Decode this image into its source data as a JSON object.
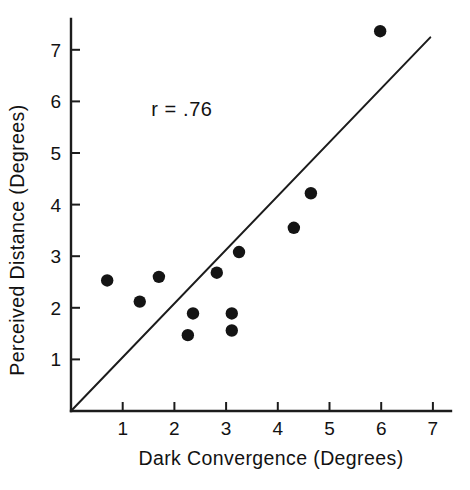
{
  "chart_data": {
    "type": "scatter",
    "title": "",
    "xlabel": "Dark Convergence  (Degrees)",
    "ylabel": "Perceived Distance (Degrees)",
    "xlim": [
      0,
      7.35
    ],
    "ylim": [
      0,
      7.6
    ],
    "xticks": [
      1,
      2,
      3,
      4,
      5,
      6,
      7
    ],
    "xticklabels": [
      "1",
      "2",
      "3",
      "4",
      "5",
      "6",
      "7"
    ],
    "yticks": [
      1,
      2,
      3,
      4,
      5,
      6,
      7
    ],
    "yticklabels": [
      "1",
      "2",
      "3",
      "4",
      "5",
      "6",
      "7"
    ],
    "grid": false,
    "legend": false,
    "annotations": [
      {
        "name": "correlation-annotation",
        "text": "r = .76",
        "x": 1.55,
        "y": 5.72
      }
    ],
    "reference_line": {
      "name": "identity-line",
      "description": "straight line from origin through data",
      "x0": 0.0,
      "y0": 0.0,
      "x1": 6.95,
      "y1": 7.24
    },
    "points": [
      {
        "x": 0.7,
        "y": 2.53
      },
      {
        "x": 1.33,
        "y": 2.12
      },
      {
        "x": 1.7,
        "y": 2.6
      },
      {
        "x": 2.26,
        "y": 1.47
      },
      {
        "x": 2.36,
        "y": 1.89
      },
      {
        "x": 2.82,
        "y": 2.68
      },
      {
        "x": 3.11,
        "y": 1.89
      },
      {
        "x": 3.11,
        "y": 1.56
      },
      {
        "x": 3.25,
        "y": 3.08
      },
      {
        "x": 4.31,
        "y": 3.55
      },
      {
        "x": 4.64,
        "y": 4.22
      },
      {
        "x": 5.98,
        "y": 7.36
      }
    ],
    "marker": {
      "shape": "circle",
      "color": "#141414",
      "radius_px": 6.2
    },
    "axis_color": "#1c1c1c"
  }
}
